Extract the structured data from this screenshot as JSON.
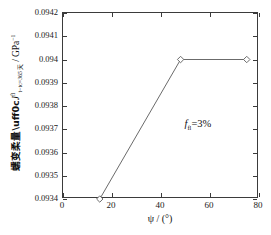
{
  "chart_data": {
    "type": "line",
    "title": "",
    "xlabel": "ψ / (°)",
    "ylabel_cjk": "蠕变柔量",
    "ylabel_symbol": "J",
    "ylabel_superscript": "fl",
    "ylabel_subscript": "t−tᴄ=365 天",
    "ylabel_units": "GPa",
    "ylabel_units_exponent": "−1",
    "ylabel_full": "蠕变柔量，J fl t−tc=365天 / GPa⁻¹",
    "xlim": [
      0,
      80
    ],
    "ylim": [
      0.0934,
      0.0942
    ],
    "xticks": [
      0,
      20,
      40,
      60,
      80
    ],
    "xtick_labels": [
      "0",
      "20",
      "40",
      "60",
      "80"
    ],
    "yticks": [
      0.0934,
      0.0935,
      0.0936,
      0.0937,
      0.0938,
      0.0939,
      0.094,
      0.0941,
      0.0942
    ],
    "ytick_labels": [
      "0.0934",
      "0.0935",
      "0.0936",
      "0.0937",
      "0.0938",
      "0.0939",
      "0.094",
      "0.0941",
      "0.0942"
    ],
    "grid": false,
    "legend": false,
    "marker": "diamond",
    "line_color": "#6b6b6b",
    "marker_edge_color": "#6b6b6b",
    "marker_face_color": "#ffffff",
    "axis_color": "#3b3b3b",
    "background_color": "#ffffff",
    "x": [
      15,
      48,
      75
    ],
    "y": [
      0.0934,
      0.094,
      0.094
    ],
    "series": [
      {
        "name": "creep compliance",
        "points": [
          {
            "x": 15,
            "y": 0.0934
          },
          {
            "x": 48,
            "y": 0.094
          },
          {
            "x": 75,
            "y": 0.094
          }
        ]
      }
    ],
    "annotations": [
      {
        "name": "fiber-fraction",
        "symbol": "f",
        "subscript": "fl",
        "text": "=3%",
        "full": "fₑ=3%",
        "x": 50,
        "y": 0.09374
      }
    ]
  }
}
